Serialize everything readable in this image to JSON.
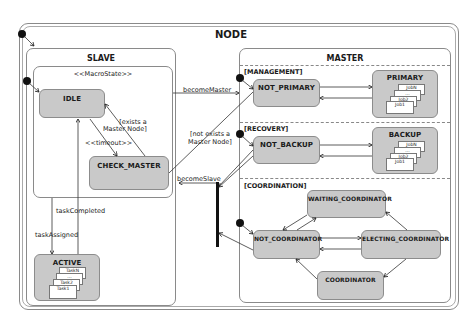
{
  "diagram": {
    "node_title": "NODE",
    "slave": {
      "title": "SLAVE",
      "macrostate_label": "<<MacroState>>",
      "states": {
        "idle": "IDLE",
        "check_master": "CHECK_MASTER",
        "active": "ACTIVE"
      },
      "active_tasks": [
        "TaskN",
        "...",
        "Task2",
        "Task1"
      ]
    },
    "master": {
      "title": "MASTER",
      "regions": {
        "management": "[MANAGEMENT]",
        "recovery": "[RECOVERY]",
        "coordination": "[COORDINATION]"
      },
      "states": {
        "not_primary": "NOT_PRIMARY",
        "primary": "PRIMARY",
        "not_backup": "NOT_BACKUP",
        "backup": "BACKUP",
        "waiting_coordinator": "WAITING_COORDINATOR",
        "not_coordinator": "NOT_COORDINATOR",
        "electing_coordinator": "ELECTING_COORDINATOR",
        "coordinator": "COORDINATOR"
      },
      "primary_jobs": [
        "JobN",
        "...",
        "Job2",
        "Job1"
      ],
      "backup_jobs": [
        "JobN",
        "...",
        "Job2",
        "Job1"
      ]
    },
    "transitions": {
      "become_master": "becomeMaster",
      "become_slave": "becomeSlave",
      "exists_master_line1": "[exists a",
      "exists_master_line2": "Master Node]",
      "not_exists_master_line1": "[not exists a",
      "not_exists_master_line2": "Master Node]",
      "timeout": "<<timeout>>",
      "task_completed": "taskCompleted",
      "task_assigned": "taskAssigned"
    }
  }
}
